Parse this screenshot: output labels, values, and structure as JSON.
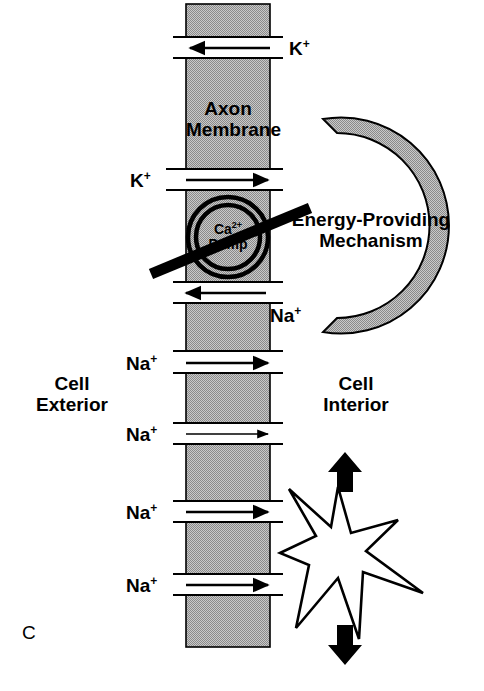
{
  "figure": {
    "panel_letter": "C",
    "background_color": "#ffffff",
    "ink_color": "#000000",
    "membrane_fill_color": "#a8a8a8",
    "crescent_fill_color": "#a8a8a8"
  },
  "labels": {
    "axon_membrane": "Axon\nMembrane",
    "axon_membrane_line1": "Axon",
    "axon_membrane_line2": "Membrane",
    "cell_exterior_line1": "Cell",
    "cell_exterior_line2": "Exterior",
    "cell_interior_line1": "Cell",
    "cell_interior_line2": "Interior",
    "energy_mechanism_line1": "Energy-Providing",
    "energy_mechanism_line2": "Mechanism",
    "pump_line1_ion": "Ca",
    "pump_line1_charge": "2+",
    "pump_line2": "Pump"
  },
  "channels": [
    {
      "id": "channel-k-efflux",
      "ion": "K",
      "charge": "+",
      "direction": "left",
      "label_side": "right",
      "arrow_weight": "medium",
      "y": 47
    },
    {
      "id": "channel-k-influx",
      "ion": "K",
      "charge": "+",
      "direction": "right",
      "label_side": "left",
      "arrow_weight": "medium",
      "y": 179
    },
    {
      "id": "channel-na-efflux",
      "ion": "Na",
      "charge": "+",
      "direction": "left",
      "label_side": "right",
      "arrow_weight": "medium",
      "y": 292
    },
    {
      "id": "channel-na-influx-1",
      "ion": "Na",
      "charge": "+",
      "direction": "right",
      "label_side": "left",
      "arrow_weight": "medium",
      "y": 362
    },
    {
      "id": "channel-na-influx-2",
      "ion": "Na",
      "charge": "+",
      "direction": "right",
      "label_side": "left",
      "arrow_weight": "thin",
      "y": 433
    },
    {
      "id": "channel-na-influx-3",
      "ion": "Na",
      "charge": "+",
      "direction": "right",
      "label_side": "left",
      "arrow_weight": "medium",
      "y": 511
    },
    {
      "id": "channel-na-influx-4",
      "ion": "Na",
      "charge": "+",
      "direction": "right",
      "label_side": "left",
      "arrow_weight": "medium",
      "y": 584
    }
  ],
  "annotations": {
    "pump_blocked": true,
    "blocking_bar": "diagonal-strikethrough",
    "starburst": "excitation-burst",
    "arrow_up": "propagation-arrow-up",
    "arrow_down": "propagation-arrow-down"
  }
}
